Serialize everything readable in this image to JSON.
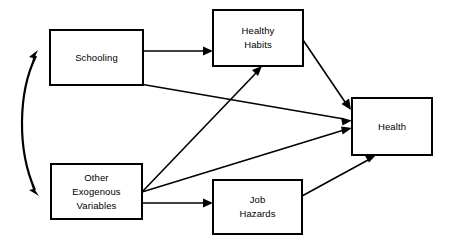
{
  "diagram": {
    "background_color": "#ffffff",
    "line_color": "#000000",
    "box_fill_color": "#ffffff",
    "nodes": [
      {
        "id": "schooling",
        "label": "Schooling",
        "lines": [
          "Schooling"
        ],
        "x": 50,
        "y": 30,
        "width": 93,
        "height": 55
      },
      {
        "id": "healthy_habits",
        "label": "Healthy Habits",
        "lines": [
          "Healthy",
          "Habits"
        ],
        "x": 213,
        "y": 10,
        "width": 90,
        "height": 56
      },
      {
        "id": "other_exogenous_variables",
        "label": "Other Exogenous Variables",
        "lines": [
          "Other",
          "Exogenous",
          "Variables"
        ],
        "x": 51,
        "y": 164,
        "width": 91,
        "height": 55
      },
      {
        "id": "job_hazards",
        "label": "Job Hazards",
        "lines": [
          "Job",
          "Hazards"
        ],
        "x": 213,
        "y": 180,
        "width": 89,
        "height": 54
      },
      {
        "id": "health",
        "label": "Health",
        "lines": [
          "Health"
        ],
        "x": 352,
        "y": 98,
        "width": 80,
        "height": 57
      }
    ],
    "edges": [
      {
        "id": "schooling-to-healthy-habits",
        "from": "schooling",
        "to": "healthy_habits",
        "type": "straight",
        "arrowheads": "end"
      },
      {
        "id": "schooling-to-health",
        "from": "schooling",
        "to": "health",
        "type": "straight",
        "arrowheads": "end"
      },
      {
        "id": "other-exogenous-to-healthy-habits",
        "from": "other_exogenous_variables",
        "to": "healthy_habits",
        "type": "straight",
        "arrowheads": "end"
      },
      {
        "id": "other-exogenous-to-health",
        "from": "other_exogenous_variables",
        "to": "health",
        "type": "straight",
        "arrowheads": "end"
      },
      {
        "id": "other-exogenous-to-job-hazards",
        "from": "other_exogenous_variables",
        "to": "job_hazards",
        "type": "straight",
        "arrowheads": "end"
      },
      {
        "id": "healthy-habits-to-health",
        "from": "healthy_habits",
        "to": "health",
        "type": "straight",
        "arrowheads": "end"
      },
      {
        "id": "job-hazards-to-health",
        "from": "job_hazards",
        "to": "health",
        "type": "straight",
        "arrowheads": "end"
      },
      {
        "id": "schooling-other-exogenous-correlation",
        "from": "schooling",
        "to": "other_exogenous_variables",
        "type": "curved",
        "arrowheads": "both"
      }
    ]
  }
}
